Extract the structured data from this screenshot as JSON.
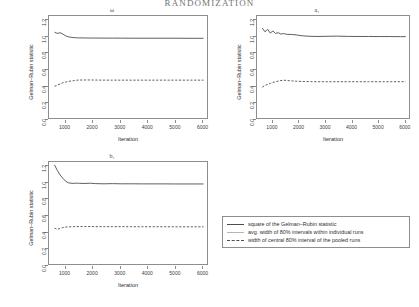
{
  "header": {
    "running_title": "RANDOMIZATION"
  },
  "legend": {
    "items": [
      {
        "label": "square of the Gelman–Rubin statistic",
        "style": "solid-dark",
        "color": "#4d4d4d"
      },
      {
        "label": "avg. width of 80% intervals within individual runs",
        "style": "solid-light",
        "color": "#b6b6b6"
      },
      {
        "label": "width of central 80% interval of the pooled runs",
        "style": "dashed",
        "color": "#4d4d4d"
      }
    ]
  },
  "axis_common": {
    "ylabel": "Gelman–Rubin statistic",
    "xlabel": "Iteration",
    "yticks": [
      "0.0",
      "0.2",
      "0.4",
      "0.6",
      "0.8",
      "1.0",
      "1.2"
    ],
    "xticks": [
      "1000",
      "2000",
      "3000",
      "4000",
      "5000",
      "6000"
    ]
  },
  "chart_data": [
    {
      "type": "line",
      "title": "ω",
      "panel_id": "omega",
      "xlabel": "Iteration",
      "ylabel": "Gelman–Rubin statistic",
      "xlim": [
        400,
        6200
      ],
      "ylim": [
        0.0,
        1.25
      ],
      "grid": false,
      "legend_position": "external-bottom-right",
      "x": [
        600,
        700,
        800,
        900,
        1000,
        1100,
        1200,
        1300,
        1400,
        1500,
        1700,
        1900,
        2100,
        2400,
        2700,
        3000,
        3400,
        3800,
        4200,
        4600,
        5000,
        5400,
        5800,
        6000
      ],
      "series": [
        {
          "name": "square of the Gelman–Rubin statistic",
          "style": "solid-dark",
          "values": [
            1.055,
            1.041,
            1.049,
            1.033,
            1.012,
            1.0,
            0.994,
            0.99,
            0.988,
            0.987,
            0.986,
            0.985,
            0.985,
            0.984,
            0.984,
            0.984,
            0.983,
            0.983,
            0.983,
            0.983,
            0.983,
            0.982,
            0.982,
            0.982
          ]
        },
        {
          "name": "width of central 80% interval of the pooled runs",
          "style": "dashed",
          "values": [
            0.405,
            0.42,
            0.432,
            0.447,
            0.455,
            0.463,
            0.469,
            0.473,
            0.478,
            0.48,
            0.481,
            0.481,
            0.48,
            0.479,
            0.479,
            0.479,
            0.479,
            0.479,
            0.479,
            0.479,
            0.479,
            0.479,
            0.479,
            0.479
          ]
        }
      ]
    },
    {
      "type": "line",
      "title": "a₁",
      "panel_id": "a1",
      "xlabel": "Iteration",
      "ylabel": "Gelman–Rubin statistic",
      "xlim": [
        400,
        6200
      ],
      "ylim": [
        0.0,
        1.25
      ],
      "grid": false,
      "legend_position": "external-bottom-right",
      "x": [
        600,
        700,
        800,
        900,
        1000,
        1100,
        1200,
        1300,
        1400,
        1500,
        1700,
        1900,
        2100,
        2400,
        2700,
        3000,
        3400,
        3800,
        4200,
        4600,
        5000,
        5400,
        5800,
        6000
      ],
      "series": [
        {
          "name": "square of the Gelman–Rubin statistic",
          "style": "solid-dark",
          "values": [
            1.105,
            1.06,
            1.09,
            1.045,
            1.07,
            1.04,
            1.05,
            1.032,
            1.04,
            1.03,
            1.028,
            1.022,
            1.012,
            1.006,
            1.004,
            1.006,
            1.008,
            1.005,
            1.004,
            1.004,
            1.003,
            1.003,
            1.002,
            1.002
          ]
        },
        {
          "name": "width of central 80% interval of the pooled runs",
          "style": "dashed",
          "values": [
            0.395,
            0.415,
            0.428,
            0.44,
            0.452,
            0.46,
            0.468,
            0.474,
            0.478,
            0.476,
            0.47,
            0.466,
            0.463,
            0.461,
            0.46,
            0.46,
            0.46,
            0.46,
            0.46,
            0.46,
            0.46,
            0.46,
            0.46,
            0.46
          ]
        }
      ]
    },
    {
      "type": "line",
      "title": "b₁",
      "panel_id": "b1",
      "xlabel": "Iteration",
      "ylabel": "Gelman–Rubin statistic",
      "xlim": [
        400,
        6200
      ],
      "ylim": [
        0.0,
        1.25
      ],
      "grid": false,
      "legend_position": "external-right",
      "x": [
        600,
        700,
        800,
        900,
        1000,
        1100,
        1200,
        1300,
        1400,
        1500,
        1700,
        1900,
        2100,
        2400,
        2700,
        3000,
        3400,
        3800,
        4200,
        4600,
        5000,
        5400,
        5800,
        6000
      ],
      "series": [
        {
          "name": "square of the Gelman–Rubin statistic",
          "style": "solid-dark",
          "values": [
            1.215,
            1.15,
            1.095,
            1.055,
            1.02,
            1.0,
            0.995,
            0.993,
            0.996,
            0.994,
            0.992,
            0.995,
            0.99,
            0.988,
            0.99,
            0.988,
            0.988,
            0.987,
            0.987,
            0.987,
            0.986,
            0.986,
            0.986,
            0.986
          ]
        },
        {
          "name": "width of central 80% interval of the pooled runs",
          "style": "dashed",
          "values": [
            0.455,
            0.44,
            0.452,
            0.462,
            0.468,
            0.47,
            0.472,
            0.473,
            0.474,
            0.474,
            0.474,
            0.474,
            0.473,
            0.473,
            0.473,
            0.473,
            0.472,
            0.472,
            0.472,
            0.472,
            0.471,
            0.471,
            0.471,
            0.471
          ]
        }
      ]
    }
  ]
}
